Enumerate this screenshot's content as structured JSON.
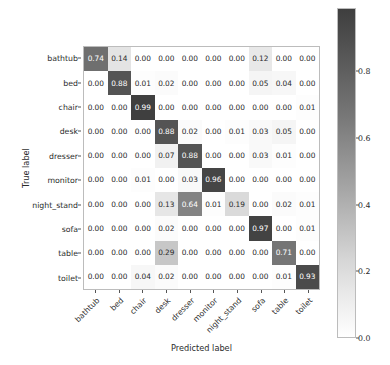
{
  "chart_data": {
    "type": "heatmap",
    "title": "",
    "xlabel": "Predicted label",
    "ylabel": "True label",
    "categories_x": [
      "bathtub",
      "bed",
      "chair",
      "desk",
      "dresser",
      "monitor",
      "night_stand",
      "sofa",
      "table",
      "toilet"
    ],
    "categories_y": [
      "bathtub",
      "bed",
      "chair",
      "desk",
      "dresser",
      "monitor",
      "night_stand",
      "sofa",
      "table",
      "toilet"
    ],
    "matrix": [
      [
        0.74,
        0.14,
        0.0,
        0.0,
        0.0,
        0.0,
        0.0,
        0.12,
        0.0,
        0.0
      ],
      [
        0.0,
        0.88,
        0.01,
        0.02,
        0.0,
        0.0,
        0.0,
        0.05,
        0.04,
        0.0
      ],
      [
        0.0,
        0.0,
        0.99,
        0.0,
        0.0,
        0.0,
        0.0,
        0.0,
        0.0,
        0.01
      ],
      [
        0.0,
        0.0,
        0.0,
        0.88,
        0.02,
        0.0,
        0.01,
        0.03,
        0.05,
        0.0
      ],
      [
        0.0,
        0.0,
        0.0,
        0.07,
        0.88,
        0.0,
        0.0,
        0.03,
        0.01,
        0.0
      ],
      [
        0.0,
        0.0,
        0.01,
        0.0,
        0.03,
        0.96,
        0.0,
        0.0,
        0.0,
        0.0
      ],
      [
        0.0,
        0.0,
        0.0,
        0.13,
        0.64,
        0.01,
        0.19,
        0.0,
        0.02,
        0.01
      ],
      [
        0.0,
        0.0,
        0.0,
        0.02,
        0.0,
        0.0,
        0.0,
        0.97,
        0.0,
        0.01
      ],
      [
        0.0,
        0.0,
        0.0,
        0.29,
        0.0,
        0.0,
        0.0,
        0.0,
        0.71,
        0.0
      ],
      [
        0.0,
        0.0,
        0.04,
        0.02,
        0.0,
        0.0,
        0.0,
        0.0,
        0.01,
        0.93
      ]
    ],
    "cell_labels": [
      [
        "0.74",
        "0.14",
        "0.00",
        "0.00",
        "0.00",
        "0.00",
        "0.00",
        "0.12",
        "0.00",
        "0.00"
      ],
      [
        "0.00",
        "0.88",
        "0.01",
        "0.02",
        "0.00",
        "0.00",
        "0.00",
        "0.05",
        "0.04",
        "0.00"
      ],
      [
        "0.00",
        "0.00",
        "0.99",
        "0.00",
        "0.00",
        "0.00",
        "0.00",
        "0.00",
        "0.00",
        "0.01"
      ],
      [
        "0.00",
        "0.00",
        "0.00",
        "0.88",
        "0.02",
        "0.00",
        "0.01",
        "0.03",
        "0.05",
        "0.00"
      ],
      [
        "0.00",
        "0.00",
        "0.00",
        "0.07",
        "0.88",
        "0.00",
        "0.00",
        "0.03",
        "0.01",
        "0.00"
      ],
      [
        "0.00",
        "0.00",
        "0.01",
        "0.00",
        "0.03",
        "0.96",
        "0.00",
        "0.00",
        "0.00",
        "0.00"
      ],
      [
        "0.00",
        "0.00",
        "0.00",
        "0.13",
        "0.64",
        "0.01",
        "0.19",
        "0.00",
        "0.02",
        "0.01"
      ],
      [
        "0.00",
        "0.00",
        "0.00",
        "0.02",
        "0.00",
        "0.00",
        "0.00",
        "0.97",
        "0.00",
        "0.01"
      ],
      [
        "0.00",
        "0.00",
        "0.00",
        "0.29",
        "0.00",
        "0.00",
        "0.00",
        "0.00",
        "0.71",
        "0.00"
      ],
      [
        "0.00",
        "0.00",
        "0.04",
        "0.02",
        "0.00",
        "0.00",
        "0.00",
        "0.00",
        "0.01",
        "0.93"
      ]
    ],
    "colormap": "greys",
    "colorbar": {
      "ticks": [
        "0.0",
        "0.2",
        "0.4",
        "0.6",
        "0.8"
      ],
      "tick_values": [
        0.0,
        0.2,
        0.4,
        0.6,
        0.8
      ],
      "vmin": 0.0,
      "vmax": 0.99,
      "position": "right",
      "orientation": "vertical"
    },
    "grid": false,
    "text_color_light": "#ffffff",
    "text_color_dark": "#2b2b2b",
    "color_low": "#ffffff",
    "color_high": "#3f3f3f",
    "axis_color": "#bcbcbc"
  }
}
